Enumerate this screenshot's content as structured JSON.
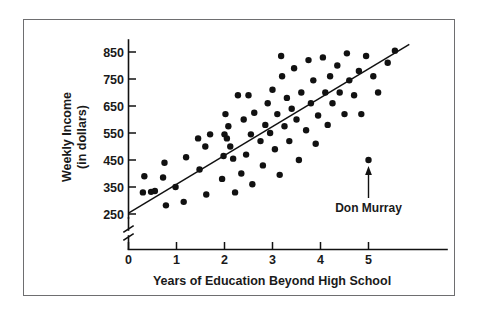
{
  "chart_data": {
    "type": "scatter",
    "title": "",
    "xlabel": "Years of Education Beyond High School",
    "ylabel_line1": "Weekly Income",
    "ylabel_line2": "(in dollars)",
    "xlim": [
      0,
      5.9
    ],
    "ylim": [
      250,
      890
    ],
    "xticks": [
      0,
      1,
      2,
      3,
      4,
      5
    ],
    "xtick_labels": [
      "0",
      "1",
      "2",
      "3",
      "4",
      "5"
    ],
    "yticks": [
      250,
      350,
      450,
      550,
      650,
      750,
      850
    ],
    "ytick_labels": [
      "250",
      "350",
      "450",
      "550",
      "650",
      "750",
      "850"
    ],
    "grid": false,
    "legend": null,
    "y_axis_break": true,
    "points": [
      [
        0.3,
        330
      ],
      [
        0.33,
        390
      ],
      [
        0.47,
        332
      ],
      [
        0.72,
        385
      ],
      [
        0.75,
        440
      ],
      [
        0.78,
        282
      ],
      [
        0.98,
        350
      ],
      [
        1.15,
        295
      ],
      [
        1.2,
        460
      ],
      [
        1.45,
        530
      ],
      [
        1.48,
        415
      ],
      [
        1.6,
        500
      ],
      [
        1.62,
        322
      ],
      [
        1.95,
        380
      ],
      [
        1.98,
        465
      ],
      [
        2.0,
        545
      ],
      [
        2.02,
        620
      ],
      [
        2.05,
        530
      ],
      [
        2.08,
        575
      ],
      [
        2.12,
        500
      ],
      [
        2.18,
        455
      ],
      [
        2.22,
        330
      ],
      [
        2.35,
        400
      ],
      [
        2.4,
        600
      ],
      [
        2.45,
        470
      ],
      [
        2.5,
        690
      ],
      [
        2.55,
        545
      ],
      [
        2.58,
        360
      ],
      [
        2.62,
        625
      ],
      [
        2.75,
        520
      ],
      [
        2.8,
        430
      ],
      [
        2.85,
        580
      ],
      [
        2.9,
        660
      ],
      [
        2.95,
        550
      ],
      [
        3.0,
        710
      ],
      [
        3.05,
        490
      ],
      [
        3.1,
        620
      ],
      [
        3.15,
        395
      ],
      [
        3.2,
        760
      ],
      [
        3.25,
        575
      ],
      [
        3.3,
        680
      ],
      [
        3.35,
        520
      ],
      [
        3.4,
        640
      ],
      [
        3.45,
        790
      ],
      [
        3.5,
        600
      ],
      [
        3.55,
        450
      ],
      [
        3.6,
        700
      ],
      [
        3.7,
        560
      ],
      [
        3.75,
        820
      ],
      [
        3.8,
        660
      ],
      [
        3.85,
        745
      ],
      [
        3.9,
        510
      ],
      [
        3.95,
        615
      ],
      [
        4.05,
        830
      ],
      [
        4.1,
        700
      ],
      [
        4.15,
        580
      ],
      [
        4.2,
        760
      ],
      [
        4.25,
        660
      ],
      [
        4.35,
        800
      ],
      [
        4.4,
        700
      ],
      [
        4.5,
        620
      ],
      [
        4.55,
        845
      ],
      [
        4.6,
        745
      ],
      [
        4.7,
        690
      ],
      [
        4.8,
        780
      ],
      [
        4.85,
        620
      ],
      [
        4.95,
        835
      ],
      [
        5.0,
        450
      ],
      [
        5.1,
        760
      ],
      [
        5.2,
        700
      ],
      [
        5.4,
        810
      ],
      [
        5.55,
        855
      ],
      [
        0.55,
        335
      ],
      [
        1.7,
        545
      ],
      [
        2.28,
        690
      ],
      [
        3.18,
        835
      ]
    ],
    "regression_line": {
      "x_start": 0.0,
      "y_start": 253,
      "x_end": 5.85,
      "y_end": 878
    },
    "annotations": [
      {
        "label": "Don Murray",
        "point_x": 5.0,
        "point_y": 450,
        "arrow": "up"
      }
    ]
  }
}
